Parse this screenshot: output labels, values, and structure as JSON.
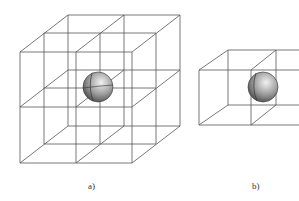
{
  "figure": {
    "panels": [
      {
        "id": "a",
        "label": "a)",
        "description": "2x2x2 cubic lattice with sphere at center"
      },
      {
        "id": "b",
        "label": "b)",
        "description": "two adjacent cubic cells with sphere at shared face"
      }
    ],
    "colors": {
      "line": "#555555",
      "sphere_light": "#e8e8e8",
      "sphere_dark": "#4a4a4a"
    }
  }
}
